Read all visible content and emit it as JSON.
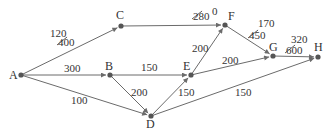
{
  "diagram": {
    "type": "directed-network",
    "colors": {
      "edge": "#6b6b6b",
      "node": "#555555",
      "text": "#333333"
    },
    "nodes": [
      {
        "id": "A",
        "label": "A",
        "x": 21,
        "y": 75,
        "lx": 9,
        "ly": 79
      },
      {
        "id": "B",
        "label": "B",
        "x": 110,
        "y": 75,
        "lx": 105,
        "ly": 70
      },
      {
        "id": "C",
        "label": "C",
        "x": 121,
        "y": 26,
        "lx": 116,
        "ly": 19
      },
      {
        "id": "D",
        "label": "D",
        "x": 151,
        "y": 116,
        "lx": 146,
        "ly": 128
      },
      {
        "id": "E",
        "label": "E",
        "x": 191,
        "y": 75,
        "lx": 183,
        "ly": 70
      },
      {
        "id": "F",
        "label": "F",
        "x": 225,
        "y": 25,
        "lx": 228,
        "ly": 20
      },
      {
        "id": "G",
        "label": "G",
        "x": 273,
        "y": 56,
        "lx": 269,
        "ly": 51
      },
      {
        "id": "H",
        "label": "H",
        "x": 318,
        "y": 57,
        "lx": 314,
        "ly": 51
      }
    ],
    "edges": [
      {
        "from": "A",
        "to": "C",
        "labels": [
          {
            "text": "120",
            "x": 50,
            "y": 37,
            "struck": false
          },
          {
            "text": "400",
            "x": 58,
            "y": 46,
            "struck": true
          }
        ]
      },
      {
        "from": "C",
        "to": "F",
        "labels": [
          {
            "text": "280",
            "x": 193,
            "y": 20,
            "struck": true
          },
          {
            "text": "0",
            "x": 212,
            "y": 15,
            "struck": false
          }
        ]
      },
      {
        "from": "A",
        "to": "B",
        "labels": [
          {
            "text": "300",
            "x": 64,
            "y": 72,
            "struck": false
          }
        ]
      },
      {
        "from": "B",
        "to": "E",
        "labels": [
          {
            "text": "150",
            "x": 141,
            "y": 71,
            "struck": false
          }
        ]
      },
      {
        "from": "B",
        "to": "D",
        "labels": [
          {
            "text": "200",
            "x": 131,
            "y": 96,
            "struck": false
          }
        ]
      },
      {
        "from": "A",
        "to": "D",
        "labels": [
          {
            "text": "100",
            "x": 71,
            "y": 104,
            "struck": false
          }
        ]
      },
      {
        "from": "D",
        "to": "E",
        "labels": [
          {
            "text": "150",
            "x": 178,
            "y": 96,
            "struck": false
          }
        ]
      },
      {
        "from": "D",
        "to": "H",
        "labels": [
          {
            "text": "150",
            "x": 235,
            "y": 96,
            "struck": false
          }
        ]
      },
      {
        "from": "E",
        "to": "F",
        "labels": [
          {
            "text": "200",
            "x": 192,
            "y": 52,
            "struck": false
          }
        ]
      },
      {
        "from": "E",
        "to": "G",
        "labels": [
          {
            "text": "200",
            "x": 222,
            "y": 64,
            "struck": false
          }
        ]
      },
      {
        "from": "F",
        "to": "G",
        "labels": [
          {
            "text": "170",
            "x": 258,
            "y": 27,
            "struck": false
          },
          {
            "text": "450",
            "x": 249,
            "y": 39,
            "struck": true
          }
        ]
      },
      {
        "from": "G",
        "to": "H",
        "labels": [
          {
            "text": "320",
            "x": 291,
            "y": 43,
            "struck": false
          },
          {
            "text": "600",
            "x": 286,
            "y": 54,
            "struck": true
          }
        ]
      }
    ]
  }
}
